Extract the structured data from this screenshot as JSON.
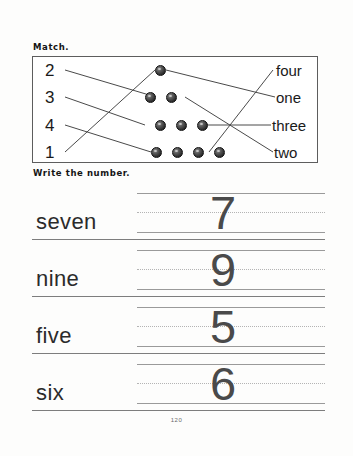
{
  "page": {
    "page_number": "120",
    "width": 353,
    "height": 456,
    "ink_color": "#1a1a1a",
    "rule_color": "#9a9a9a"
  },
  "match_section": {
    "heading": "Match.",
    "numbers": [
      "2",
      "3",
      "4",
      "1"
    ],
    "words": [
      "four",
      "one",
      "three",
      "two"
    ],
    "dot_rows": [
      {
        "count": 1,
        "dots": 1
      },
      {
        "count": 2,
        "dots": 2
      },
      {
        "count": 3,
        "dots": 3
      },
      {
        "count": 4,
        "dots": 4
      }
    ],
    "connections_left": [
      {
        "from_number": "2",
        "to_dot_row": 2
      },
      {
        "from_number": "3",
        "to_dot_row": 3
      },
      {
        "from_number": "4",
        "to_dot_row": 4
      },
      {
        "from_number": "1",
        "to_dot_row": 1
      }
    ],
    "connections_right": [
      {
        "from_dot_row": 1,
        "to_word": "one"
      },
      {
        "from_dot_row": 2,
        "to_word": "two"
      },
      {
        "from_dot_row": 3,
        "to_word": "three"
      },
      {
        "from_dot_row": 4,
        "to_word": "four"
      }
    ]
  },
  "write_section": {
    "heading": "Write the number.",
    "rows": [
      {
        "word": "seven",
        "numeral": "7"
      },
      {
        "word": "nine",
        "numeral": "9"
      },
      {
        "word": "five",
        "numeral": "5"
      },
      {
        "word": "six",
        "numeral": "6"
      }
    ]
  }
}
